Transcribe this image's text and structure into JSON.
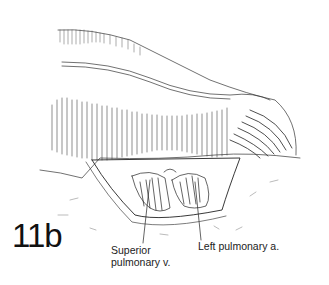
{
  "figure": {
    "label": "11b",
    "annotations": [
      {
        "id": "superior-pulmonary-vein",
        "line1": "Superior",
        "line2": "pulmonary v."
      },
      {
        "id": "left-pulmonary-artery",
        "line1": "Left pulmonary a."
      }
    ]
  },
  "colors": {
    "ink": "#222222",
    "background": "#ffffff"
  }
}
